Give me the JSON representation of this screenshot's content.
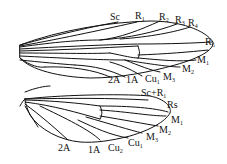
{
  "diagram": {
    "type": "insect wing venation",
    "forewing": {
      "labels": [
        {
          "id": "sc",
          "main": "Sc",
          "sub": "",
          "x": 110,
          "y": 12
        },
        {
          "id": "r1",
          "main": "R",
          "sub": "1",
          "x": 135,
          "y": 11
        },
        {
          "id": "r2",
          "main": "R",
          "sub": "2",
          "x": 159,
          "y": 12
        },
        {
          "id": "r3",
          "main": "R",
          "sub": "3",
          "x": 175,
          "y": 15
        },
        {
          "id": "r4",
          "main": "R",
          "sub": "4",
          "x": 188,
          "y": 18
        },
        {
          "id": "r5",
          "main": "R",
          "sub": "5",
          "x": 205,
          "y": 37
        },
        {
          "id": "m1",
          "main": "M",
          "sub": "1",
          "x": 197,
          "y": 55
        },
        {
          "id": "m2",
          "main": "M",
          "sub": "2",
          "x": 182,
          "y": 64
        },
        {
          "id": "m3",
          "main": "M",
          "sub": "3",
          "x": 163,
          "y": 72
        },
        {
          "id": "cu1",
          "main": "Cu",
          "sub": "1",
          "x": 145,
          "y": 74
        },
        {
          "id": "1a",
          "main": "1A",
          "sub": "",
          "x": 126,
          "y": 75
        },
        {
          "id": "2a",
          "main": "2A",
          "sub": "",
          "x": 108,
          "y": 75
        }
      ]
    },
    "hindwing": {
      "labels": [
        {
          "id": "scr1",
          "main": "Sc+R",
          "sub": "1",
          "x": 141,
          "y": 88
        },
        {
          "id": "rs",
          "main": "Rs",
          "sub": "",
          "x": 167,
          "y": 100
        },
        {
          "id": "m1",
          "main": "M",
          "sub": "1",
          "x": 171,
          "y": 115
        },
        {
          "id": "m2",
          "main": "M",
          "sub": "2",
          "x": 159,
          "y": 125
        },
        {
          "id": "m3",
          "main": "M",
          "sub": "3",
          "x": 146,
          "y": 132
        },
        {
          "id": "cu1",
          "main": "Cu",
          "sub": "1",
          "x": 128,
          "y": 138
        },
        {
          "id": "cu2",
          "main": "Cu",
          "sub": "2",
          "x": 108,
          "y": 143
        },
        {
          "id": "1a",
          "main": "1A",
          "sub": "",
          "x": 88,
          "y": 145
        },
        {
          "id": "2a",
          "main": "2A",
          "sub": "",
          "x": 58,
          "y": 143
        }
      ]
    }
  }
}
